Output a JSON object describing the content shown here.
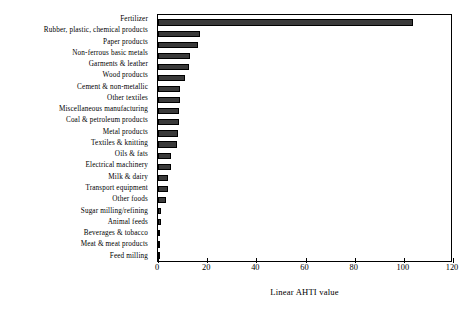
{
  "chart_data": {
    "type": "bar",
    "orientation": "horizontal",
    "title": "",
    "xlabel": "Linear AHTI value",
    "ylabel": "",
    "xlim": [
      0,
      120
    ],
    "xticks": [
      0,
      20,
      40,
      60,
      80,
      100,
      120
    ],
    "xtick_labels": [
      "0",
      "20",
      "40",
      "60",
      "80",
      "100",
      "120"
    ],
    "grid": false,
    "legend": false,
    "bar_color": "#3a3a3a",
    "bar_edge_color": "#000000",
    "categories": [
      "Fertilizer",
      "Rubber, plastic, chemical products",
      "Paper products",
      "Non-ferrous basic metals",
      "Garments & leather",
      "Wood products",
      "Cement & non-metallic",
      "Other textiles",
      "Miscellaneous manufacturing",
      "Coal & petroleum products",
      "Metal products",
      "Textiles & knitting",
      "Oils & fats",
      "Electrical machinery",
      "Milk & dairy",
      "Transport equipment",
      "Other foods",
      "Sugar milling/refining",
      "Animal feeds",
      "Beverages & tobacco",
      "Meat & meat products",
      "Feed milling"
    ],
    "values": [
      103.7,
      17.1,
      16.3,
      13.0,
      12.6,
      10.9,
      9.0,
      8.8,
      8.5,
      8.4,
      8.2,
      7.8,
      5.3,
      5.1,
      4.1,
      3.9,
      3.3,
      1.4,
      1.3,
      1.0,
      0.9,
      0.6
    ]
  }
}
